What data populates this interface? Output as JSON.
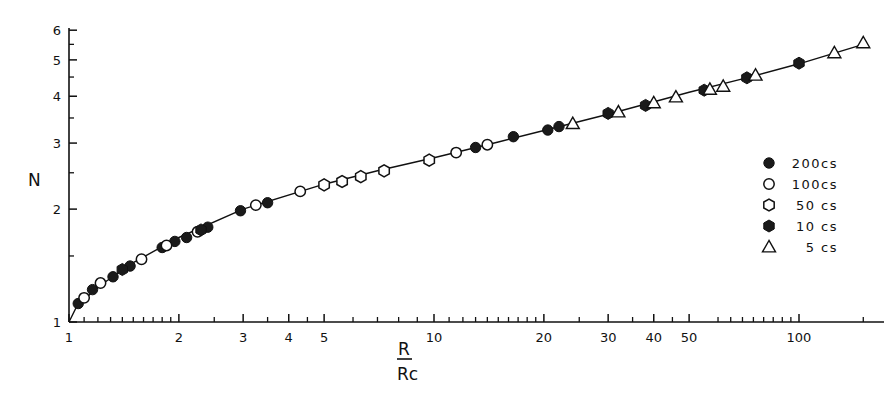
{
  "chart_data": {
    "type": "scatter",
    "title": "",
    "xlabel": "R / Rc",
    "xlabel_numerator": "R",
    "xlabel_denominator": "Rc",
    "ylabel": "N",
    "xscale": "log",
    "yscale": "log",
    "xlim": [
      1,
      160
    ],
    "ylim": [
      1,
      6
    ],
    "grid": false,
    "legend_position": "right-middle",
    "x_ticks": [
      "1",
      "2",
      "3",
      "4",
      "5",
      "10",
      "20",
      "30",
      "40",
      "50",
      "100"
    ],
    "x_tick_values": [
      1,
      2,
      3,
      4,
      5,
      10,
      20,
      30,
      40,
      50,
      100
    ],
    "y_ticks": [
      "1",
      "2",
      "3",
      "4",
      "5",
      "6"
    ],
    "y_tick_values": [
      1,
      2,
      3,
      4,
      5,
      6
    ],
    "fit_curve": {
      "description": "smooth master curve through all points",
      "x": [
        1.0,
        1.05,
        1.2,
        1.5,
        2.0,
        3.0,
        5.0,
        7.0,
        10.0,
        15.0,
        20.0,
        30.0,
        50.0,
        70.0,
        100.0,
        150.0
      ],
      "y": [
        1.0,
        1.1,
        1.24,
        1.44,
        1.68,
        2.0,
        2.33,
        2.53,
        2.74,
        3.02,
        3.24,
        3.58,
        4.1,
        4.45,
        4.88,
        5.5
      ]
    },
    "series": [
      {
        "name": "200cs",
        "marker": "filled-circle",
        "points": [
          [
            1.06,
            1.12
          ],
          [
            1.16,
            1.22
          ],
          [
            1.32,
            1.32
          ],
          [
            1.47,
            1.41
          ],
          [
            1.8,
            1.58
          ],
          [
            1.95,
            1.64
          ],
          [
            2.1,
            1.68
          ],
          [
            2.4,
            1.79
          ],
          [
            2.95,
            1.98
          ],
          [
            3.5,
            2.08
          ],
          [
            13.0,
            2.92
          ],
          [
            16.5,
            3.12
          ],
          [
            20.5,
            3.25
          ],
          [
            22.0,
            3.32
          ]
        ]
      },
      {
        "name": "100cs",
        "marker": "open-circle",
        "points": [
          [
            1.1,
            1.16
          ],
          [
            1.22,
            1.27
          ],
          [
            1.58,
            1.47
          ],
          [
            1.85,
            1.6
          ],
          [
            2.25,
            1.74
          ],
          [
            3.25,
            2.05
          ],
          [
            4.3,
            2.23
          ],
          [
            11.5,
            2.83
          ],
          [
            14.0,
            2.97
          ]
        ]
      },
      {
        "name": "50cs",
        "marker": "open-hexagon",
        "points": [
          [
            5.0,
            2.32
          ],
          [
            5.6,
            2.37
          ],
          [
            6.3,
            2.44
          ],
          [
            7.3,
            2.53
          ],
          [
            9.7,
            2.7
          ]
        ]
      },
      {
        "name": "10cs",
        "marker": "filled-hexagon",
        "points": [
          [
            1.4,
            1.38
          ],
          [
            2.3,
            1.76
          ],
          [
            30.0,
            3.6
          ],
          [
            38.0,
            3.78
          ],
          [
            55.0,
            4.15
          ],
          [
            72.0,
            4.48
          ],
          [
            100.0,
            4.9
          ]
        ]
      },
      {
        "name": "5cs",
        "marker": "open-triangle",
        "points": [
          [
            24.0,
            3.38
          ],
          [
            32.0,
            3.63
          ],
          [
            40.0,
            3.84
          ],
          [
            46.0,
            3.98
          ],
          [
            57.0,
            4.17
          ],
          [
            62.0,
            4.25
          ],
          [
            76.0,
            4.55
          ],
          [
            125.0,
            5.22
          ],
          [
            150.0,
            5.55
          ]
        ]
      }
    ],
    "legend": [
      {
        "label": "200cs",
        "marker": "filled-circle"
      },
      {
        "label": "100cs",
        "marker": "open-circle"
      },
      {
        "label": "50 cs",
        "marker": "open-hexagon"
      },
      {
        "label": "10 cs",
        "marker": "filled-hexagon"
      },
      {
        "label": "5 cs",
        "marker": "open-triangle"
      }
    ]
  },
  "axes": {
    "y_title": "N",
    "x_title_num": "R",
    "x_title_den": "Rc"
  }
}
